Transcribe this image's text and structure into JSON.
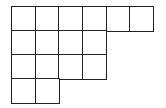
{
  "diagram": {
    "type": "young-diagram",
    "row_lengths": [
      6,
      4,
      4,
      2
    ],
    "origin": [
      12,
      7
    ],
    "cell_width": 23.6,
    "cell_height": 24,
    "line_color": "#222222",
    "fill_color": "#ffffff"
  }
}
